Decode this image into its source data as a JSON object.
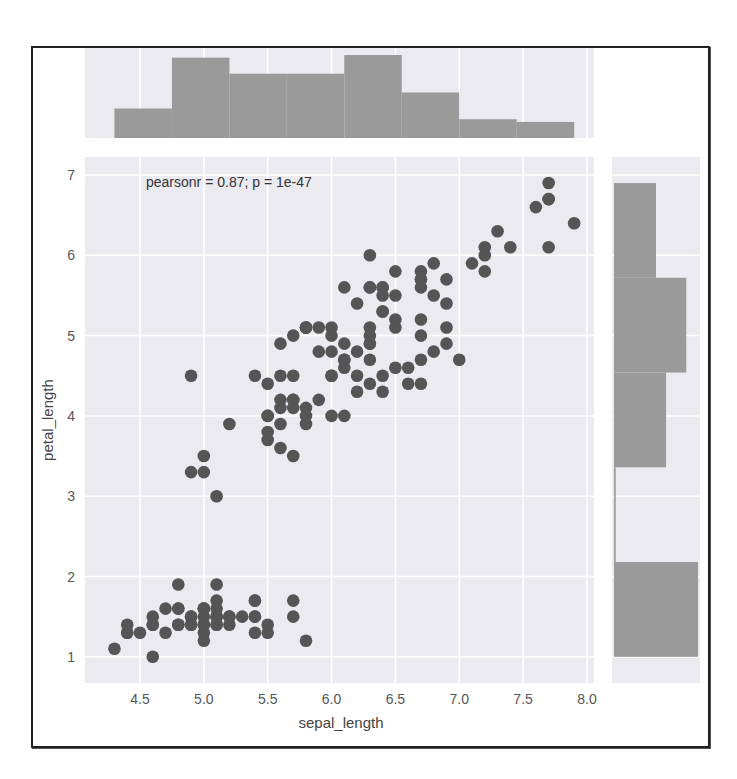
{
  "chart_data": {
    "type": "scatter",
    "kind": "jointplot",
    "xlabel": "sepal_length",
    "ylabel": "petal_length",
    "annotation": "pearsonr = 0.87; p = 1e-47",
    "x_ticks": [
      "4.5",
      "5.0",
      "5.5",
      "6.0",
      "6.5",
      "7.0",
      "7.5",
      "8.0"
    ],
    "y_ticks": [
      "1",
      "2",
      "3",
      "4",
      "5",
      "6",
      "7"
    ],
    "xlim": [
      4.0,
      8.1
    ],
    "ylim": [
      0.6,
      7.2
    ],
    "grid": true,
    "colors": {
      "points": "#555555",
      "hist": "#9a9a9a",
      "background": "#eaeaf0",
      "grid": "#ffffff"
    },
    "points": [
      [
        5.1,
        1.4
      ],
      [
        4.9,
        1.4
      ],
      [
        4.7,
        1.3
      ],
      [
        4.6,
        1.5
      ],
      [
        5.0,
        1.4
      ],
      [
        5.4,
        1.7
      ],
      [
        4.6,
        1.4
      ],
      [
        5.0,
        1.5
      ],
      [
        4.4,
        1.4
      ],
      [
        4.9,
        1.5
      ],
      [
        5.4,
        1.5
      ],
      [
        4.8,
        1.6
      ],
      [
        4.8,
        1.4
      ],
      [
        4.3,
        1.1
      ],
      [
        5.8,
        1.2
      ],
      [
        5.7,
        1.5
      ],
      [
        5.4,
        1.3
      ],
      [
        5.1,
        1.4
      ],
      [
        5.7,
        1.7
      ],
      [
        5.1,
        1.5
      ],
      [
        5.4,
        1.7
      ],
      [
        5.1,
        1.5
      ],
      [
        4.6,
        1.0
      ],
      [
        5.1,
        1.7
      ],
      [
        4.8,
        1.9
      ],
      [
        5.0,
        1.6
      ],
      [
        5.0,
        1.6
      ],
      [
        5.2,
        1.5
      ],
      [
        5.2,
        1.4
      ],
      [
        4.7,
        1.6
      ],
      [
        4.8,
        1.6
      ],
      [
        5.4,
        1.5
      ],
      [
        5.2,
        1.5
      ],
      [
        5.5,
        1.4
      ],
      [
        4.9,
        1.5
      ],
      [
        5.0,
        1.2
      ],
      [
        5.5,
        1.3
      ],
      [
        4.9,
        1.4
      ],
      [
        4.4,
        1.3
      ],
      [
        5.1,
        1.5
      ],
      [
        5.0,
        1.3
      ],
      [
        4.5,
        1.3
      ],
      [
        4.4,
        1.3
      ],
      [
        5.0,
        1.6
      ],
      [
        5.1,
        1.9
      ],
      [
        4.8,
        1.4
      ],
      [
        5.1,
        1.6
      ],
      [
        4.6,
        1.4
      ],
      [
        5.3,
        1.5
      ],
      [
        5.0,
        1.4
      ],
      [
        7.0,
        4.7
      ],
      [
        6.4,
        4.5
      ],
      [
        6.9,
        4.9
      ],
      [
        5.5,
        4.0
      ],
      [
        6.5,
        4.6
      ],
      [
        5.7,
        4.5
      ],
      [
        6.3,
        4.7
      ],
      [
        4.9,
        3.3
      ],
      [
        6.6,
        4.6
      ],
      [
        5.2,
        3.9
      ],
      [
        5.0,
        3.5
      ],
      [
        5.9,
        4.2
      ],
      [
        6.0,
        4.0
      ],
      [
        6.1,
        4.7
      ],
      [
        5.6,
        3.6
      ],
      [
        6.7,
        4.4
      ],
      [
        5.6,
        4.5
      ],
      [
        5.8,
        4.1
      ],
      [
        6.2,
        4.5
      ],
      [
        5.6,
        3.9
      ],
      [
        5.9,
        4.8
      ],
      [
        6.1,
        4.0
      ],
      [
        6.3,
        4.9
      ],
      [
        6.1,
        4.7
      ],
      [
        6.4,
        4.3
      ],
      [
        6.6,
        4.4
      ],
      [
        6.8,
        4.8
      ],
      [
        6.7,
        5.0
      ],
      [
        6.0,
        4.5
      ],
      [
        5.7,
        3.5
      ],
      [
        5.5,
        3.8
      ],
      [
        5.5,
        3.7
      ],
      [
        5.8,
        3.9
      ],
      [
        6.0,
        5.1
      ],
      [
        5.4,
        4.5
      ],
      [
        6.0,
        4.5
      ],
      [
        6.7,
        4.7
      ],
      [
        6.3,
        4.4
      ],
      [
        5.6,
        4.1
      ],
      [
        5.5,
        4.0
      ],
      [
        5.5,
        4.4
      ],
      [
        6.1,
        4.6
      ],
      [
        5.8,
        4.0
      ],
      [
        5.0,
        3.3
      ],
      [
        5.6,
        4.2
      ],
      [
        5.7,
        4.2
      ],
      [
        5.7,
        4.2
      ],
      [
        6.2,
        4.3
      ],
      [
        5.1,
        3.0
      ],
      [
        5.7,
        4.1
      ],
      [
        6.3,
        6.0
      ],
      [
        5.8,
        5.1
      ],
      [
        7.1,
        5.9
      ],
      [
        6.3,
        5.6
      ],
      [
        6.5,
        5.8
      ],
      [
        7.6,
        6.6
      ],
      [
        4.9,
        4.5
      ],
      [
        7.3,
        6.3
      ],
      [
        6.7,
        5.8
      ],
      [
        7.2,
        6.1
      ],
      [
        6.5,
        5.1
      ],
      [
        6.4,
        5.3
      ],
      [
        6.8,
        5.5
      ],
      [
        5.7,
        5.0
      ],
      [
        5.8,
        5.1
      ],
      [
        6.4,
        5.3
      ],
      [
        6.5,
        5.5
      ],
      [
        7.7,
        6.7
      ],
      [
        7.7,
        6.9
      ],
      [
        6.0,
        5.0
      ],
      [
        6.9,
        5.7
      ],
      [
        5.6,
        4.9
      ],
      [
        7.7,
        6.7
      ],
      [
        6.3,
        4.9
      ],
      [
        6.7,
        5.7
      ],
      [
        7.2,
        6.0
      ],
      [
        6.2,
        4.8
      ],
      [
        6.1,
        4.9
      ],
      [
        6.4,
        5.6
      ],
      [
        7.2,
        5.8
      ],
      [
        7.4,
        6.1
      ],
      [
        7.9,
        6.4
      ],
      [
        6.4,
        5.6
      ],
      [
        6.3,
        5.1
      ],
      [
        6.1,
        5.6
      ],
      [
        7.7,
        6.1
      ],
      [
        6.3,
        5.6
      ],
      [
        6.4,
        5.5
      ],
      [
        6.0,
        4.8
      ],
      [
        6.9,
        5.4
      ],
      [
        6.7,
        5.6
      ],
      [
        6.9,
        5.1
      ],
      [
        5.8,
        5.1
      ],
      [
        6.8,
        5.9
      ],
      [
        6.7,
        5.7
      ],
      [
        6.7,
        5.2
      ],
      [
        6.3,
        5.0
      ],
      [
        6.5,
        5.2
      ],
      [
        6.2,
        5.4
      ],
      [
        5.9,
        5.1
      ]
    ],
    "marginal_x_hist": {
      "variable": "sepal_length",
      "bin_edges": [
        4.3,
        4.75,
        5.2,
        5.65,
        6.1,
        6.55,
        7.0,
        7.45,
        7.9
      ],
      "counts": [
        11,
        30,
        24,
        24,
        31,
        17,
        7,
        6
      ]
    },
    "marginal_y_hist": {
      "variable": "petal_length",
      "bin_edges": [
        1.0,
        2.18,
        3.36,
        4.54,
        5.72,
        6.9
      ],
      "counts": [
        50,
        1,
        31,
        43,
        25
      ]
    }
  }
}
